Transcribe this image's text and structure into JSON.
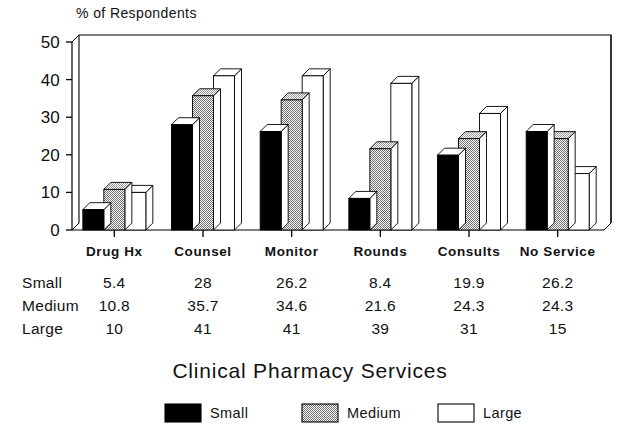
{
  "chart_data": {
    "type": "bar",
    "title": "Clinical Pharmacy Services",
    "ylabel": "% of Respondents",
    "xlabel": "Clinical Pharmacy Services",
    "categories": [
      "Drug Hx",
      "Counsel",
      "Monitor",
      "Rounds",
      "Consults",
      "No Service"
    ],
    "series": [
      {
        "name": "Small",
        "values": [
          5.4,
          28,
          26.2,
          8.4,
          19.9,
          26.2
        ]
      },
      {
        "name": "Medium",
        "values": [
          10.8,
          35.7,
          34.6,
          21.6,
          24.3,
          24.3
        ]
      },
      {
        "name": "Large",
        "values": [
          10,
          41,
          41,
          39,
          31,
          15
        ]
      }
    ],
    "ylim": [
      0,
      50
    ],
    "yticks": [
      0,
      10,
      20,
      30,
      40,
      50
    ],
    "ytick_labels": [
      "0",
      "10",
      "20",
      "30",
      "40",
      "50"
    ],
    "grid": false,
    "legend_position": "bottom",
    "style": "3d-bars"
  },
  "axis": {
    "y_title": "% of Respondents",
    "tick_labels": [
      "50",
      "40",
      "30",
      "20",
      "10",
      "0"
    ],
    "category_labels": [
      "Drug Hx",
      "Counsel",
      "Monitor",
      "Rounds",
      "Consults",
      "No Service"
    ]
  },
  "data_table": {
    "rows": [
      {
        "label": "Small",
        "values": [
          "5.4",
          "28",
          "26.2",
          "8.4",
          "19.9",
          "26.2"
        ]
      },
      {
        "label": "Medium",
        "values": [
          "10.8",
          "35.7",
          "34.6",
          "21.6",
          "24.3",
          "24.3"
        ]
      },
      {
        "label": "Large",
        "values": [
          "10",
          "41",
          "41",
          "39",
          "31",
          "15"
        ]
      }
    ]
  },
  "caption": {
    "text": "Clinical Pharmacy Services"
  },
  "legend": {
    "items": [
      {
        "label": "Small",
        "fill": "#000000",
        "pattern": "solid"
      },
      {
        "label": "Medium",
        "fill": "#b4b4b4",
        "pattern": "checker"
      },
      {
        "label": "Large",
        "fill": "#ffffff",
        "pattern": "empty"
      }
    ]
  },
  "colors": {
    "small": "#000000",
    "medium": "#b4b4b4",
    "large": "#ffffff",
    "stroke": "#000000",
    "background": "#ffffff"
  }
}
